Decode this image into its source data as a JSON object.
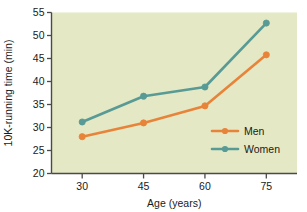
{
  "chart_data": {
    "type": "line",
    "title": "",
    "xlabel": "Age (years)",
    "ylabel": "10K-running time (min)",
    "x": [
      30,
      45,
      60,
      75
    ],
    "xtick_labels": [
      "30",
      "45",
      "60",
      "75"
    ],
    "ytick_labels": [
      "20",
      "25",
      "30",
      "35",
      "40",
      "45",
      "50",
      "55"
    ],
    "yticks": [
      20,
      25,
      30,
      35,
      40,
      45,
      50,
      55
    ],
    "xlim": [
      22.5,
      82.5
    ],
    "ylim": [
      20,
      55
    ],
    "grid": false,
    "legend_position": "inside-lower-right",
    "plot_background_color": "#E4E8C4",
    "series": [
      {
        "name": "Men",
        "color": "#E8843A",
        "values": [
          28.0,
          31.0,
          34.7,
          45.8
        ]
      },
      {
        "name": "Women",
        "color": "#589A95",
        "values": [
          31.2,
          36.8,
          38.8,
          52.7
        ]
      }
    ]
  },
  "legend": {
    "items": [
      {
        "label": "Men",
        "color": "#E8843A"
      },
      {
        "label": "Women",
        "color": "#589A95"
      }
    ]
  },
  "axes": {
    "x_title": "Age (years)",
    "y_title": "10K-running time (min)"
  }
}
